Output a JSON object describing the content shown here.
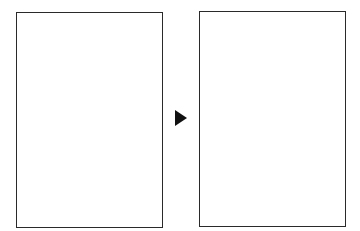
{
  "diagram": {
    "type": "transition",
    "panels": [
      {
        "id": "before",
        "content": ""
      },
      {
        "id": "after",
        "content": ""
      }
    ],
    "arrow": {
      "direction": "right",
      "icon": "play-triangle-icon",
      "color": "#111111"
    },
    "border_color": "#2a2a2a",
    "background": "#ffffff"
  }
}
